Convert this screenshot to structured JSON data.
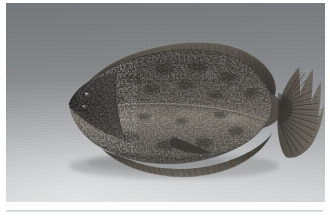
{
  "document": {
    "background_color": "#ffffff",
    "figure_alt": "Photograph of a flatfish (flounder) lying on a plain graduated grey studio background, viewed from its eyed (dark) side, head to the left and fanned tail fin to the right."
  },
  "figure": {
    "name": "flatfish-photograph",
    "orientation": "head-left, tail-right, lateral view",
    "plate": {
      "left_px": 6,
      "top_px": 3,
      "width_px": 319,
      "height_px": 199
    },
    "background": {
      "type": "vertical-gradient-studio-sweep",
      "top_color": "#6e7174",
      "middle_color": "#999c9f",
      "bottom_color": "#d6d8d9",
      "description": "Seamless studio sweep, dark grey at top grading to pale grey at bottom"
    },
    "body": {
      "fill_dark": "#2e2b28",
      "fill_mid": "#433e38",
      "fill_light": "#5d564e",
      "belly_light": "#6f675d",
      "speckle_color": "#17150f",
      "lateral_line_color": "#8e857a"
    },
    "fins": {
      "dorsal_color": "#3a352f",
      "anal_color": "#3a352f",
      "caudal_color": "#4a443c",
      "ray_color": "#201d19",
      "ray_count_caudal": 22,
      "ray_count_dorsal": 46,
      "ray_count_anal": 38
    },
    "head": {
      "eye_color": "#100f0d",
      "eye_highlight": "#b9b3a8",
      "mouth_color": "#121110"
    }
  },
  "rule": {
    "name": "bottom-separator-rule",
    "top_px": 210,
    "color": "#c6c9cb"
  }
}
